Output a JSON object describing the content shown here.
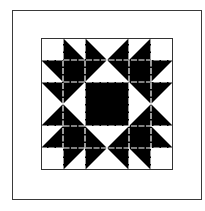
{
  "figure": {
    "grid_size": 6,
    "colors": {
      "dark": "#000000",
      "light": "#ffffff",
      "frame": "#3a3a3a",
      "seam": "#ffffff"
    },
    "cells": [
      [
        "W",
        "BL",
        "BL",
        "BR",
        "BR",
        "W"
      ],
      [
        "TR",
        "B",
        "TL",
        "TR",
        "B",
        "TL"
      ],
      [
        "TR",
        "TL",
        "C",
        "C",
        "TR",
        "TL"
      ],
      [
        "BR",
        "BL",
        "C",
        "C",
        "BR",
        "BL"
      ],
      [
        "BR",
        "B",
        "BL",
        "BR",
        "B",
        "BL"
      ],
      [
        "W",
        "TL",
        "TL",
        "TR",
        "TR",
        "W"
      ]
    ],
    "center_square": {
      "row": 2,
      "col": 2,
      "span": 2
    }
  }
}
